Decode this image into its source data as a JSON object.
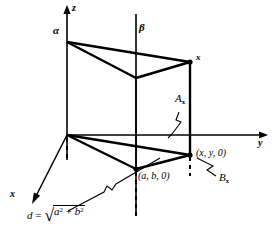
{
  "figure": {
    "axes": {
      "z_label": "z",
      "y_label": "y",
      "x_label": "x"
    },
    "planes": {
      "alpha_label": "α",
      "beta_label": "β"
    },
    "points": {
      "x_vector_label": "x",
      "xy0_label": "(x, y, 0)",
      "ab0_label": "(a, b, 0)"
    },
    "regions": {
      "A_label": "A",
      "A_subscript": "x",
      "B_label": "B",
      "B_subscript": "x"
    },
    "formula": {
      "lhs": "d",
      "equals": "=",
      "radical": "√",
      "radicand_a": "a",
      "radicand_a_exp": "2",
      "plus": "+",
      "radicand_b": "b",
      "radicand_b_exp": "2"
    },
    "colors": {
      "ink": "#000000",
      "background": "#ffffff"
    }
  }
}
